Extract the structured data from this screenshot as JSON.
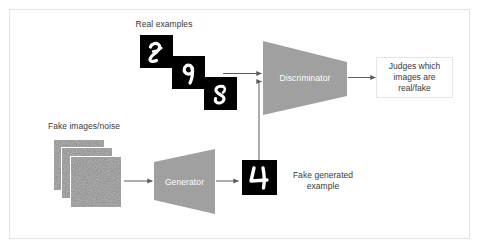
{
  "diagram": {
    "background_color": "#ffffff",
    "frame_color": "#e2e2e2",
    "text_color": "#3a3a3a",
    "block_fill": "#a0a0a0",
    "block_text_color": "#ffffff",
    "connector_color": "#5a5a5a",
    "tile_background": "#000000",
    "tile_stroke_color": "#ffffff",
    "noise_color": "#8c8c8c"
  },
  "labels": {
    "real_examples": "Real examples",
    "fake_images_noise": "Fake images/noise",
    "fake_generated_example": "Fake generated\nexample"
  },
  "blocks": {
    "discriminator": {
      "label": "Discriminator",
      "shape": "trapezoid-narrowing-right"
    },
    "generator": {
      "label": "Generator",
      "shape": "trapezoid-widening-right"
    }
  },
  "output": {
    "discriminator_output": "Judges which\nimages are\nreal/fake"
  },
  "real_examples": [
    {
      "digit": "2"
    },
    {
      "digit": "9"
    },
    {
      "digit": "8"
    }
  ],
  "generated_example": {
    "digit": "4"
  },
  "noise_tiles": [
    {
      "index": 1
    },
    {
      "index": 2
    },
    {
      "index": 3
    }
  ]
}
